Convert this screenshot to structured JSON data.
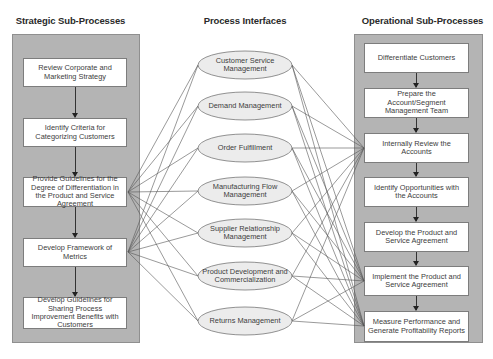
{
  "columns": {
    "strategic": {
      "title": "Strategic Sub-Processes",
      "items": [
        "Review Corporate and Marketing Strategy",
        "Identify Criteria for Categorizing Customers",
        "Provide Guidelines for the Degree of Differentiation in the Product and Service Agreement",
        "Develop Framework of Metrics",
        "Develop Guidelines for Sharing Process Improvement Benefits with Customers"
      ]
    },
    "interfaces": {
      "title": "Process Interfaces",
      "items": [
        "Customer Service Management",
        "Demand Management",
        "Order Fulfillment",
        "Manufacturing Flow Management",
        "Supplier Relationship Management",
        "Product Development and Commercialization",
        "Returns Management"
      ]
    },
    "operational": {
      "title": "Operational Sub-Processes",
      "items": [
        "Differentiate Customers",
        "Prepare the Account/Segment Management Team",
        "Internally Review the Accounts",
        "Identify Opportunities with the Accounts",
        "Develop the Product and Service Agreement",
        "Implement the Product and Service Agreement",
        "Measure Performance and Generate Profitability Reports"
      ]
    }
  },
  "links": {
    "strategic_to_interfaces": {
      "from_strategic_items": [
        2,
        3
      ],
      "to_all_interfaces": true
    },
    "interfaces_to_operational": {
      "to_operational_items": [
        2,
        5,
        6
      ],
      "from_all_interfaces": true
    }
  },
  "colors": {
    "panel": "#b4b4b4",
    "box": "#ffffff",
    "ellipse": "#ececec",
    "line": "#555555"
  }
}
